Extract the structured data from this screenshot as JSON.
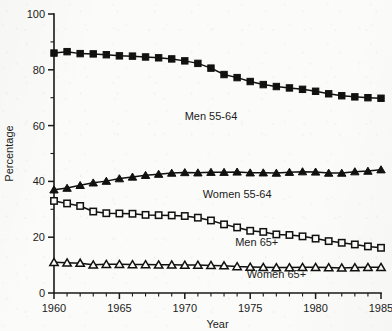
{
  "chart_data": {
    "type": "line",
    "title": "",
    "xlabel": "Year",
    "ylabel": "Percentage",
    "xlim": [
      1960,
      1985
    ],
    "ylim": [
      0,
      100
    ],
    "grid": false,
    "legend_position": "inline-annotations",
    "x_major_ticks": [
      1960,
      1965,
      1970,
      1975,
      1980,
      1985
    ],
    "x_minor_tick_step": 1,
    "y_major_ticks": [
      0,
      20,
      40,
      60,
      80,
      100
    ],
    "y_minor_tick_step": 10,
    "x": [
      1960,
      1961,
      1962,
      1963,
      1964,
      1965,
      1966,
      1967,
      1968,
      1969,
      1970,
      1971,
      1972,
      1973,
      1974,
      1975,
      1976,
      1977,
      1978,
      1979,
      1980,
      1981,
      1982,
      1983,
      1984,
      1985
    ],
    "series": [
      {
        "name": "Men 55-64",
        "marker": "filled-square",
        "label_x": 1972.0,
        "label_y": 62,
        "values": [
          86.0,
          86.5,
          85.8,
          85.7,
          85.4,
          85.0,
          84.9,
          84.6,
          84.3,
          83.9,
          83.2,
          82.3,
          80.6,
          78.3,
          77.2,
          75.8,
          74.7,
          74.0,
          73.5,
          73.0,
          72.3,
          71.4,
          70.7,
          70.3,
          70.0,
          69.8
        ]
      },
      {
        "name": "Women 55-64",
        "marker": "filled-triangle",
        "label_x": 1974.0,
        "label_y": 34,
        "values": [
          37.0,
          37.6,
          38.6,
          39.5,
          40.1,
          41.0,
          41.6,
          42.2,
          42.6,
          43.0,
          43.2,
          43.1,
          43.3,
          43.3,
          43.4,
          43.1,
          43.1,
          43.0,
          43.3,
          43.5,
          43.4,
          43.0,
          43.0,
          43.5,
          43.7,
          44.2
        ]
      },
      {
        "name": "Men 65+",
        "marker": "open-square",
        "label_x": 1975.5,
        "label_y": 17,
        "values": [
          33.0,
          32.1,
          31.2,
          29.2,
          28.6,
          28.5,
          28.4,
          28.0,
          27.9,
          27.8,
          27.6,
          27.0,
          26.0,
          24.6,
          23.5,
          22.3,
          21.9,
          21.0,
          20.8,
          20.3,
          19.5,
          18.6,
          18.0,
          17.4,
          16.7,
          16.2
        ]
      },
      {
        "name": "Women 65+",
        "marker": "open-triangle",
        "label_x": 1977.0,
        "label_y": 5.5,
        "values": [
          11.0,
          10.8,
          10.7,
          10.1,
          10.3,
          10.3,
          10.2,
          10.2,
          10.1,
          10.1,
          10.0,
          10.0,
          9.9,
          9.8,
          9.5,
          9.3,
          9.2,
          9.1,
          9.1,
          9.2,
          9.2,
          9.1,
          9.0,
          9.1,
          9.2,
          9.2
        ]
      }
    ]
  }
}
